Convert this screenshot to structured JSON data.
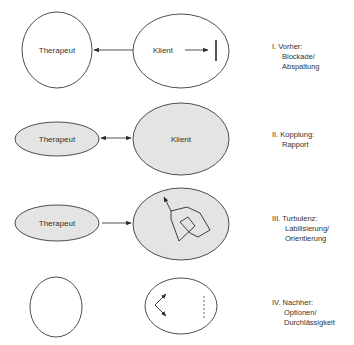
{
  "colors": {
    "stroke": "#3a3a3a",
    "fill_shaded": "#e4e4e2",
    "text": "#333333",
    "background": "#ffffff"
  },
  "stages": [
    {
      "number": "I.",
      "title": "Vorher:",
      "subtitle_lines": [
        "Blockade/",
        "Abspaltung"
      ],
      "therapist_label": "Therapeut",
      "client_label": "Klient",
      "connection": "arrow client to therapist",
      "inner_symbol": "arrow-to-barrier"
    },
    {
      "number": "II.",
      "title": "Kopplung:",
      "subtitle_lines": [
        "Rapport"
      ],
      "therapist_label": "Therapeut",
      "client_label": "Klient",
      "connection": "double-headed arrow",
      "inner_symbol": "none"
    },
    {
      "number": "III.",
      "title": "Turbulenz:",
      "subtitle_lines": [
        "Labilisierung/",
        "Orientierung"
      ],
      "therapist_label": "Therapeut",
      "client_label": "",
      "connection": "arrow therapist to client",
      "inner_symbol": "tangled-path-arrow"
    },
    {
      "number": "IV.",
      "title": "Nachher:",
      "subtitle_lines": [
        "Optionen/",
        "Durchlässigkeit"
      ],
      "therapist_label": "",
      "client_label": "",
      "connection": "none",
      "inner_symbol": "branching-arrows-dashed-barrier"
    }
  ]
}
